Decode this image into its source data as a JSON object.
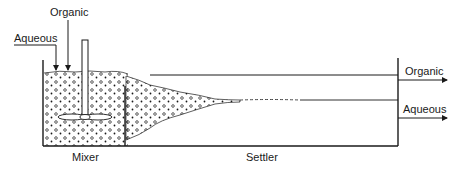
{
  "diagram": {
    "type": "mixer-settler schematic",
    "labels": {
      "inlet_organic": "Organic",
      "inlet_aqueous": "Aqueous",
      "outlet_organic": "Organic",
      "outlet_aqueous": "Aqueous",
      "mixer": "Mixer",
      "settler": "Settler"
    },
    "colors": {
      "stroke": "#1a1a1a",
      "background": "#ffffff"
    }
  }
}
